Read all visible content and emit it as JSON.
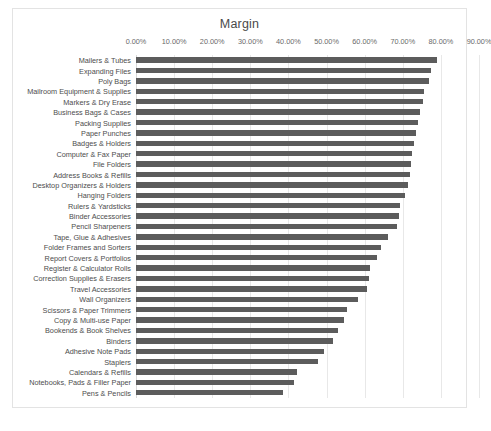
{
  "chart_data": {
    "type": "bar",
    "orientation": "horizontal",
    "title": "Margin",
    "xlabel": "",
    "ylabel": "",
    "xlim": [
      0,
      90
    ],
    "xticks": [
      0,
      10,
      20,
      30,
      40,
      50,
      60,
      70,
      80,
      90
    ],
    "xtick_labels": [
      "0.00%",
      "10.00%",
      "20.00%",
      "30.00%",
      "40.00%",
      "50.00%",
      "60.00%",
      "70.00%",
      "80.00%",
      "90.00%"
    ],
    "grid": true,
    "grid_axis": "x",
    "legend": false,
    "bar_color": "#5c5c5c",
    "value_unit": "%",
    "categories": [
      "Mailers & Tubes",
      "Expanding Files",
      "Poly Bags",
      "Mailroom Equipment & Supplies",
      "Markers & Dry Erase",
      "Business Bags & Cases",
      "Packing Supplies",
      "Paper Punches",
      "Badges & Holders",
      "Computer & Fax Paper",
      "File Folders",
      "Address Books & Refills",
      "Desktop Organizers & Holders",
      "Hanging Folders",
      "Rulers & Yardsticks",
      "Binder Accessories",
      "Pencil Sharpeners",
      "Tape, Glue & Adhesives",
      "Folder Frames and Sorters",
      "Report Covers & Portfolios",
      "Register & Calculator Rolls",
      "Correction Supplies & Erasers",
      "Travel Accessories",
      "Wall Organizers",
      "Scissors & Paper Trimmers",
      "Copy & Multi-use Paper",
      "Bookends & Book Shelves",
      "Binders",
      "Adhesive Note Pads",
      "Staplers",
      "Calendars & Refills",
      "Notebooks, Pads & Filler Paper",
      "Pens & Pencils"
    ],
    "values": [
      79.0,
      77.4,
      76.8,
      75.6,
      75.2,
      74.6,
      73.9,
      73.4,
      73.0,
      72.5,
      72.2,
      71.8,
      71.3,
      70.6,
      69.4,
      69.0,
      68.6,
      66.2,
      64.3,
      63.2,
      61.5,
      61.1,
      60.6,
      58.2,
      55.4,
      54.6,
      53.0,
      51.6,
      49.2,
      47.7,
      42.3,
      41.4,
      38.6
    ]
  }
}
